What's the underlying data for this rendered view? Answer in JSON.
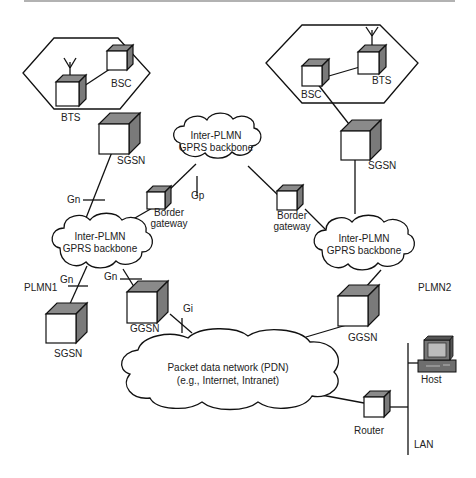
{
  "diagram": {
    "colors": {
      "stroke": "#111111",
      "cube_shade": "#7a7a7a",
      "background": "#ffffff"
    },
    "plmn_labels": {
      "plmn1": "PLMN1",
      "plmn2": "PLMN2"
    },
    "cells": {
      "left": {
        "bts": "BTS",
        "bsc": "BSC"
      },
      "right": {
        "bts": "BTS",
        "bsc": "BSC"
      }
    },
    "nodes": {
      "sgsn_top_left": "SGSN",
      "sgsn_top_right": "SGSN",
      "sgsn_bottom_left": "SGSN",
      "ggsn_left": "GGSN",
      "ggsn_right": "GGSN",
      "border_gateway_left": [
        "Border",
        "gateway"
      ],
      "border_gateway_right": [
        "Border",
        "gateway"
      ],
      "router": "Router",
      "host": "Host",
      "lan": "LAN"
    },
    "clouds": {
      "inter_plmn_center": [
        "Inter-PLMN",
        "GPRS backbone"
      ],
      "intra_left": [
        "Inter-PLMN",
        "GPRS backbone"
      ],
      "intra_right": [
        "Inter-PLMN",
        "GPRS backbone"
      ],
      "pdn": [
        "Packet data network (PDN)",
        "(e.g., Internet, Intranet)"
      ]
    },
    "interfaces": {
      "gn_top": "Gn",
      "gn_left_sgsn": "Gn",
      "gn_left_ggsn": "Gn",
      "gp": "Gp",
      "gi": "Gi"
    }
  }
}
